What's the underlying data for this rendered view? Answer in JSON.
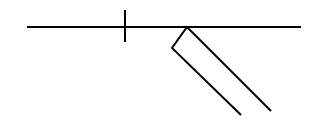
{
  "diagram": {
    "stroke_color": "#000000",
    "background": "#ffffff",
    "horizontal_line": {
      "x1": 27,
      "y1": 27,
      "x2": 301,
      "y2": 27
    },
    "tick": {
      "x1": 125,
      "y1": 10,
      "x2": 125,
      "y2": 42
    },
    "strip": {
      "top_corner": [
        187,
        27
      ],
      "left_corner": [
        172,
        48
      ],
      "left_end": [
        241,
        115
      ],
      "right_end": [
        271,
        111
      ]
    }
  }
}
